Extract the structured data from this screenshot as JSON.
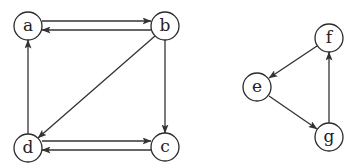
{
  "diagram": {
    "type": "directed-graph",
    "colors": {
      "stroke": "#333333",
      "node_fill": "#ffffff",
      "text": "#222222"
    },
    "node_radius": 14,
    "nodes": [
      {
        "id": "a",
        "label": "a",
        "x": 28,
        "y": 26
      },
      {
        "id": "b",
        "label": "b",
        "x": 165,
        "y": 26
      },
      {
        "id": "c",
        "label": "c",
        "x": 165,
        "y": 147
      },
      {
        "id": "d",
        "label": "d",
        "x": 28,
        "y": 148
      },
      {
        "id": "e",
        "label": "e",
        "x": 257,
        "y": 87
      },
      {
        "id": "f",
        "label": "f",
        "x": 329,
        "y": 38
      },
      {
        "id": "g",
        "label": "g",
        "x": 329,
        "y": 137
      }
    ],
    "edges": [
      {
        "from": "a",
        "to": "b",
        "x1": 42,
        "y1": 21,
        "x2": 151,
        "y2": 21
      },
      {
        "from": "b",
        "to": "a",
        "x1": 151,
        "y1": 30,
        "x2": 42,
        "y2": 30
      },
      {
        "from": "b",
        "to": "c",
        "x1": 165,
        "y1": 40,
        "x2": 165,
        "y2": 133
      },
      {
        "from": "b",
        "to": "d",
        "x1": 155,
        "y1": 36,
        "x2": 38,
        "y2": 138
      },
      {
        "from": "d",
        "to": "a",
        "x1": 28,
        "y1": 134,
        "x2": 28,
        "y2": 40
      },
      {
        "from": "d",
        "to": "c",
        "x1": 42,
        "y1": 141,
        "x2": 151,
        "y2": 141
      },
      {
        "from": "c",
        "to": "d",
        "x1": 151,
        "y1": 150,
        "x2": 42,
        "y2": 150
      },
      {
        "from": "f",
        "to": "e",
        "x1": 317,
        "y1": 46,
        "x2": 269,
        "y2": 78
      },
      {
        "from": "e",
        "to": "g",
        "x1": 269,
        "y1": 96,
        "x2": 317,
        "y2": 129
      },
      {
        "from": "g",
        "to": "f",
        "x1": 329,
        "y1": 123,
        "x2": 329,
        "y2": 52
      }
    ]
  }
}
